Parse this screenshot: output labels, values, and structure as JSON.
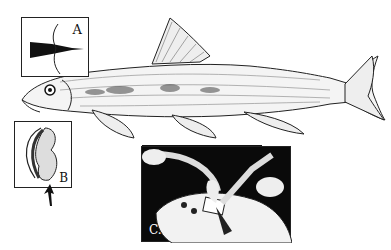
{
  "figure": {
    "panels": [
      {
        "id": "A",
        "label": "A",
        "content": "barbel / mouth detail silhouette"
      },
      {
        "id": "B",
        "label": "B",
        "content": "lip / mouth disc detail with arrow"
      },
      {
        "id": "C",
        "label": "C.",
        "content": "dissection of fish head with forceps and scalpel"
      }
    ],
    "colors": {
      "ink": "#111111",
      "background": "#ffffff",
      "panel_c_bg": "#0a0a0a"
    }
  }
}
